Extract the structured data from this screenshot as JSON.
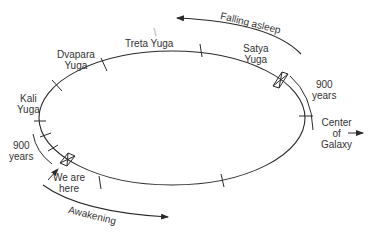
{
  "diagram": {
    "type": "orbit-cycle",
    "orbit_labels": {
      "treta": "Treta Yuga",
      "dvapara_line1": "Dvapara",
      "dvapara_line2": "Yuga",
      "kali_line1": "Kali",
      "kali_line2": "Yuga",
      "satya_line1": "Satya",
      "satya_line2": "Yuga"
    },
    "span_labels": {
      "right_900_line1": "900",
      "right_900_line2": "years",
      "left_900_line1": "900",
      "left_900_line2": "years"
    },
    "position_label": {
      "line1": "We are",
      "line2": "here"
    },
    "center_label": {
      "line1": "Center",
      "line2": "of",
      "line3": "Galaxy"
    },
    "direction_labels": {
      "falling_asleep": "Falling asleep",
      "awakening": "Awakening"
    },
    "colors": {
      "line": "#2a2a2a",
      "text": "#333333",
      "background": "#ffffff"
    }
  }
}
